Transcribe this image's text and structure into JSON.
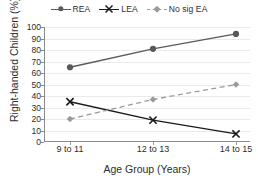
{
  "chart_data": {
    "type": "line",
    "title": "",
    "xlabel": "Age Group (Years)",
    "ylabel": "Right-handed Children (%)",
    "categories": [
      "9 to 11",
      "12 to 13",
      "14 to 15"
    ],
    "ylim": [
      0,
      100
    ],
    "ytick_step": 10,
    "yticks": [
      100,
      90,
      80,
      70,
      60,
      50,
      40,
      30,
      20,
      10,
      0
    ],
    "grid": "horizontal",
    "legend_position": "top-center",
    "series": [
      {
        "name": "REA",
        "values": [
          65,
          81,
          94
        ],
        "color": "#595959",
        "marker": "circle",
        "linestyle": "solid"
      },
      {
        "name": "LEA",
        "values": [
          35,
          19,
          7
        ],
        "color": "#1a1a1a",
        "marker": "x",
        "linestyle": "solid"
      },
      {
        "name": "No sig EA",
        "values": [
          20,
          37,
          50
        ],
        "color": "#9a9a9a",
        "marker": "diamond",
        "linestyle": "dashed"
      }
    ]
  },
  "legend": {
    "items": [
      {
        "label": "REA"
      },
      {
        "label": "LEA"
      },
      {
        "label": "No sig EA"
      }
    ]
  },
  "axes": {
    "y_title": "Right-handed Children (%)",
    "x_title": "Age Group (Years)",
    "y_ticklabels": [
      "100",
      "90",
      "80",
      "70",
      "60",
      "50",
      "40",
      "30",
      "20",
      "10",
      "0"
    ],
    "x_ticklabels": [
      "9 to 11",
      "12 to 13",
      "14 to 15"
    ]
  }
}
